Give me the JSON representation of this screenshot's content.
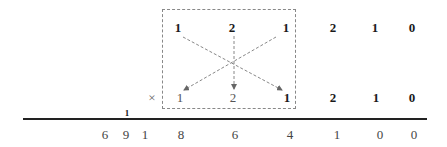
{
  "diagram": {
    "type": "cross-multiplication",
    "multiplicand": [
      "1",
      "2",
      "1",
      "2",
      "1",
      "0"
    ],
    "operator": "×",
    "multiplier": [
      "1",
      "2",
      "1",
      "2",
      "1",
      "0"
    ],
    "carry": "1",
    "result": [
      "6",
      "9",
      "1",
      "8",
      "6",
      "4",
      "1",
      "0",
      "0"
    ],
    "highlight_box": {
      "columns": [
        0,
        1,
        2
      ],
      "style": "dashed"
    },
    "arrows": [
      {
        "from": "top-col-0",
        "to": "bottom-col-2"
      },
      {
        "from": "top-col-1",
        "to": "bottom-col-1"
      },
      {
        "from": "top-col-2",
        "to": "bottom-col-0"
      }
    ],
    "colors": {
      "digits": "#1a1a1a",
      "dashes": "#888888",
      "arrows": "#777777",
      "rule": "#222222",
      "result": "#444444"
    }
  }
}
